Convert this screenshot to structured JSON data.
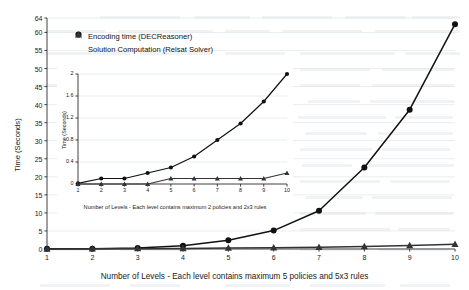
{
  "figure": {
    "background_color": "#ffffff",
    "ink_color": "#1a1a1a",
    "grid_color": "#dfe6ec"
  },
  "legend": {
    "position": "upper-left-inside",
    "entries": [
      {
        "label": "Encoding time (DECReasoner)",
        "marker": "circle-marker",
        "color": "#111111"
      },
      {
        "label": "Solution Computation (Relsat Solver)",
        "marker": "triangle-marker",
        "color": "#333333"
      }
    ]
  },
  "chart_data": [
    {
      "id": "main-chart",
      "type": "line",
      "title": "",
      "xlabel": "Number of Levels - Each level contains maximum 5 policies and 5x3 rules",
      "ylabel": "Time (Seconds)",
      "x": [
        1,
        2,
        3,
        4,
        5,
        6,
        7,
        8,
        9,
        10
      ],
      "xlim": [
        1,
        10
      ],
      "ylim": [
        0,
        64
      ],
      "xticks": [
        1,
        2,
        3,
        4,
        5,
        6,
        7,
        8,
        9,
        10
      ],
      "yticks": [
        0,
        5,
        10,
        15,
        20,
        25,
        30,
        35,
        40,
        45,
        50,
        55,
        60,
        64
      ],
      "ytick_labels": [
        "0",
        "5",
        "10",
        "15",
        "20",
        "25",
        "30",
        "35",
        "40",
        "45",
        "50",
        "55",
        "60",
        "64"
      ],
      "grid": true,
      "series": [
        {
          "name": "Encoding time (DECReasoner)",
          "marker": "circle-marker",
          "values": [
            0.05,
            0.1,
            0.3,
            0.9,
            2.4,
            5.1,
            10.6,
            22.6,
            38.6,
            62.3
          ]
        },
        {
          "name": "Solution Computation (Relsat Solver)",
          "marker": "triangle-marker",
          "values": [
            0.02,
            0.05,
            0.1,
            0.15,
            0.25,
            0.35,
            0.5,
            0.7,
            0.95,
            1.3
          ]
        }
      ]
    },
    {
      "id": "inset-chart",
      "type": "line",
      "title": "",
      "xlabel": "Number of Levels - Each level contains maximum 2 policies and 2x3 rules",
      "ylabel": "Time (Seconds)",
      "x": [
        1,
        2,
        3,
        4,
        5,
        6,
        7,
        8,
        9,
        10
      ],
      "xlim": [
        1,
        10
      ],
      "ylim": [
        0,
        2
      ],
      "xticks": [
        1,
        2,
        3,
        4,
        5,
        6,
        7,
        8,
        9,
        10
      ],
      "yticks": [
        0,
        0.4,
        0.8,
        1.2,
        1.6,
        2
      ],
      "ytick_labels": [
        "0",
        "0.4",
        "0.8",
        "1.2",
        "1.6",
        "2"
      ],
      "grid": true,
      "series": [
        {
          "name": "Encoding time (DECReasoner)",
          "marker": "circle-marker",
          "values": [
            0.01,
            0.1,
            0.1,
            0.2,
            0.3,
            0.5,
            0.8,
            1.1,
            1.5,
            2.0
          ]
        },
        {
          "name": "Solution Computation (Relsat Solver)",
          "marker": "triangle-marker",
          "values": [
            0.0,
            0.0,
            0.0,
            0.0,
            0.1,
            0.1,
            0.1,
            0.1,
            0.1,
            0.2
          ]
        }
      ]
    }
  ]
}
